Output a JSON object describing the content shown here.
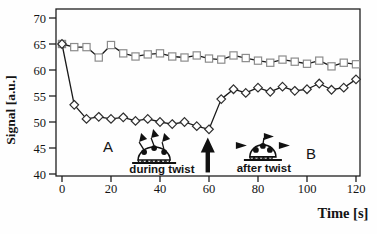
{
  "figure": {
    "background": "#fefefe"
  },
  "chart_data": {
    "type": "line",
    "title": "",
    "xlabel": "Time [s]",
    "ylabel": "Signal [a.u.]",
    "xlim": [
      0,
      120
    ],
    "ylim": [
      40,
      70
    ],
    "xticks": [
      0,
      20,
      40,
      60,
      80,
      100,
      120
    ],
    "yticks": [
      40,
      45,
      50,
      55,
      60,
      65,
      70
    ],
    "grid": false,
    "frame": true,
    "legend": "none",
    "x": [
      0,
      5,
      10,
      15,
      20,
      25,
      30,
      35,
      40,
      45,
      50,
      55,
      60,
      65,
      70,
      75,
      80,
      85,
      90,
      95,
      100,
      105,
      110,
      115,
      120
    ],
    "series": [
      {
        "name": "open-square-series",
        "marker": "square",
        "marker_color": "#8c8c8c",
        "line_color": "#1a1a1a",
        "values": [
          65.0,
          64.4,
          64.4,
          62.4,
          64.8,
          63.2,
          62.6,
          63.0,
          63.2,
          62.6,
          62.4,
          62.8,
          62.2,
          62.0,
          62.8,
          62.3,
          61.8,
          61.4,
          62.0,
          61.6,
          61.2,
          61.8,
          60.7,
          61.4,
          61.1
        ]
      },
      {
        "name": "open-diamond-series",
        "marker": "diamond",
        "marker_color": "#2e2e2e",
        "line_color": "#1a1a1a",
        "values": [
          65.0,
          53.3,
          50.6,
          51.0,
          50.6,
          50.9,
          50.2,
          50.6,
          50.0,
          49.6,
          50.0,
          49.2,
          48.6,
          54.4,
          56.3,
          55.6,
          56.6,
          55.8,
          56.8,
          56.0,
          56.3,
          57.4,
          56.2,
          56.6,
          58.2
        ]
      }
    ],
    "annotations": [
      {
        "id": "label-a",
        "type": "text",
        "style": "letter",
        "text": "A",
        "x": 18.8,
        "y": 44.2
      },
      {
        "id": "during-twist-icon",
        "type": "molecule-during",
        "x": 37.6,
        "y": 42.3
      },
      {
        "id": "during-twist-label",
        "type": "text",
        "style": "twist",
        "text": "during twist",
        "x": 40.8,
        "y": 40.2
      },
      {
        "id": "event-arrow",
        "type": "arrow-up",
        "x": 59.5,
        "y_base": 40.3,
        "y_tip": 47.0
      },
      {
        "id": "after-twist-icon",
        "type": "molecule-after",
        "x": 82.0,
        "y": 42.9
      },
      {
        "id": "after-twist-label",
        "type": "text",
        "style": "twist",
        "text": "after twist",
        "x": 82.4,
        "y": 40.4
      },
      {
        "id": "label-b",
        "type": "text",
        "style": "letter",
        "text": "B",
        "x": 101.6,
        "y": 42.8
      }
    ],
    "colors": {
      "frame": "#1f1f1f",
      "tick": "#1f1f1f",
      "annotation": "#111111"
    }
  }
}
